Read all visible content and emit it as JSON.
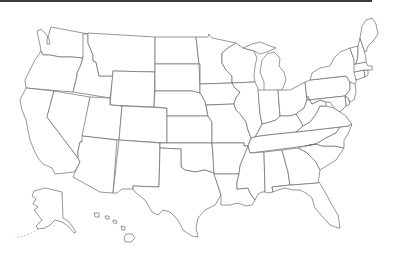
{
  "map": {
    "title": "United States blank outline map",
    "style": {
      "fill": "#ffffff",
      "stroke": "#6a6a6a",
      "top_bar_color": "#3a3a3a"
    },
    "states": [
      {
        "id": "WA",
        "name": "Washington"
      },
      {
        "id": "OR",
        "name": "Oregon"
      },
      {
        "id": "CA",
        "name": "California"
      },
      {
        "id": "ID",
        "name": "Idaho"
      },
      {
        "id": "NV",
        "name": "Nevada"
      },
      {
        "id": "MT",
        "name": "Montana"
      },
      {
        "id": "WY",
        "name": "Wyoming"
      },
      {
        "id": "UT",
        "name": "Utah"
      },
      {
        "id": "AZ",
        "name": "Arizona"
      },
      {
        "id": "CO",
        "name": "Colorado"
      },
      {
        "id": "NM",
        "name": "New Mexico"
      },
      {
        "id": "ND",
        "name": "North Dakota"
      },
      {
        "id": "SD",
        "name": "South Dakota"
      },
      {
        "id": "NE",
        "name": "Nebraska"
      },
      {
        "id": "KS",
        "name": "Kansas"
      },
      {
        "id": "OK",
        "name": "Oklahoma"
      },
      {
        "id": "TX",
        "name": "Texas"
      },
      {
        "id": "MN",
        "name": "Minnesota"
      },
      {
        "id": "IA",
        "name": "Iowa"
      },
      {
        "id": "MO",
        "name": "Missouri"
      },
      {
        "id": "AR",
        "name": "Arkansas"
      },
      {
        "id": "LA",
        "name": "Louisiana"
      },
      {
        "id": "WI",
        "name": "Wisconsin"
      },
      {
        "id": "IL",
        "name": "Illinois"
      },
      {
        "id": "MI",
        "name": "Michigan"
      },
      {
        "id": "IN",
        "name": "Indiana"
      },
      {
        "id": "OH",
        "name": "Ohio"
      },
      {
        "id": "KY",
        "name": "Kentucky"
      },
      {
        "id": "TN",
        "name": "Tennessee"
      },
      {
        "id": "MS",
        "name": "Mississippi"
      },
      {
        "id": "AL",
        "name": "Alabama"
      },
      {
        "id": "GA",
        "name": "Georgia"
      },
      {
        "id": "FL",
        "name": "Florida"
      },
      {
        "id": "SC",
        "name": "South Carolina"
      },
      {
        "id": "NC",
        "name": "North Carolina"
      },
      {
        "id": "VA",
        "name": "Virginia"
      },
      {
        "id": "WV",
        "name": "West Virginia"
      },
      {
        "id": "PA",
        "name": "Pennsylvania"
      },
      {
        "id": "NY",
        "name": "New York"
      },
      {
        "id": "NJ",
        "name": "New Jersey"
      },
      {
        "id": "DE",
        "name": "Delaware"
      },
      {
        "id": "MD",
        "name": "Maryland"
      },
      {
        "id": "CT",
        "name": "Connecticut"
      },
      {
        "id": "RI",
        "name": "Rhode Island"
      },
      {
        "id": "MA",
        "name": "Massachusetts"
      },
      {
        "id": "VT",
        "name": "Vermont"
      },
      {
        "id": "NH",
        "name": "New Hampshire"
      },
      {
        "id": "ME",
        "name": "Maine"
      },
      {
        "id": "AK",
        "name": "Alaska"
      },
      {
        "id": "HI",
        "name": "Hawaii"
      }
    ]
  }
}
